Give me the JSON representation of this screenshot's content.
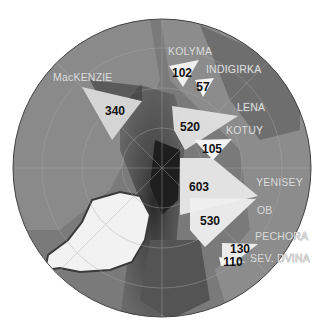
{
  "map": {
    "projection": "polar-stereographic",
    "region": "Arctic Ocean",
    "units_note": "numbers show river discharge values",
    "rivers": [
      {
        "name": "MacKENZIE",
        "value": "340"
      },
      {
        "name": "KOLYMA",
        "value": "102"
      },
      {
        "name": "INDIGIRKA",
        "value": "57"
      },
      {
        "name": "LENA",
        "value": "520"
      },
      {
        "name": "KOTUY",
        "value": "105"
      },
      {
        "name": "YENISEY",
        "value": "603"
      },
      {
        "name": "OB",
        "value": "530"
      },
      {
        "name": "PECHORA",
        "value": "130"
      },
      {
        "name": "SEV. DVINA",
        "value": "110"
      }
    ]
  }
}
